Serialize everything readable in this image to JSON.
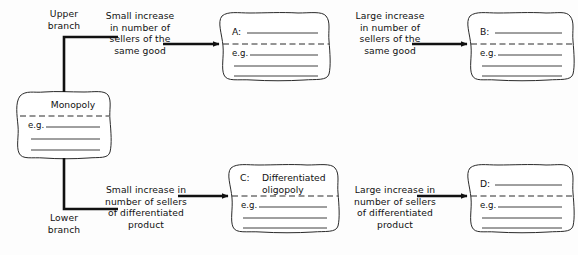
{
  "diagram": {
    "background_color": "#fdfdfd",
    "ink_color": "#111111"
  },
  "branches": {
    "upper": "Upper\nbranch",
    "lower": "Lower\nbranch"
  },
  "source_box": {
    "id": "monopoly",
    "title": "Monopoly",
    "eg_label": "e.g.",
    "blank_lines": 3
  },
  "arrows": [
    {
      "id": "arrow-upper-left",
      "label": "Small increase\nin number of\nsellers of the\nsame good"
    },
    {
      "id": "arrow-upper-right",
      "label": "Large increase\nin number of\nsellers of the\nsame good"
    },
    {
      "id": "arrow-lower-left",
      "label": "Small increase in\nnumber of sellers\nof differentiated\nproduct"
    },
    {
      "id": "arrow-lower-right",
      "label": "Large increase in\nnumber of sellers\nof differentiated\nproduct"
    }
  ],
  "answer_boxes": [
    {
      "id": "box-a",
      "prompt": "A:",
      "answer": "",
      "has_answer_rule": true,
      "eg_label": "e.g.",
      "blank_lines": 3
    },
    {
      "id": "box-b",
      "prompt": "B:",
      "answer": "",
      "has_answer_rule": true,
      "eg_label": "e.g.",
      "blank_lines": 3
    },
    {
      "id": "box-c",
      "prompt": "C:",
      "answer": "Differentiated\noligopoly",
      "has_answer_rule": false,
      "eg_label": "e.g.",
      "blank_lines": 3
    },
    {
      "id": "box-d",
      "prompt": "D:",
      "answer": "",
      "has_answer_rule": true,
      "eg_label": "e.g.",
      "blank_lines": 3
    }
  ]
}
